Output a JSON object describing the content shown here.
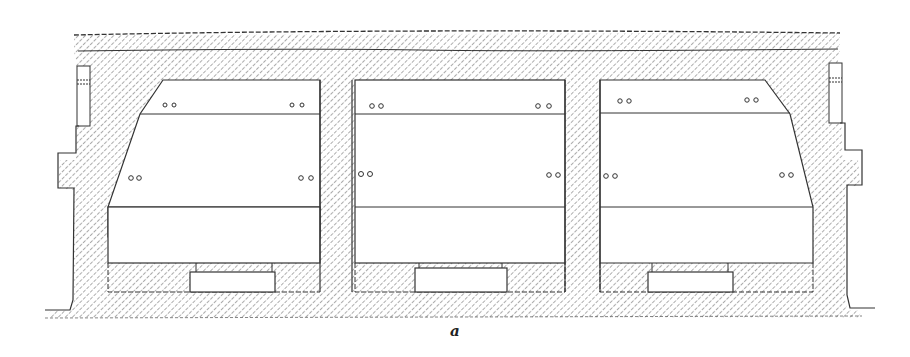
{
  "figure": {
    "caption": "a",
    "colors": {
      "ink": "#2a2a2a",
      "hatch": "#555555",
      "background": "#ffffff"
    }
  },
  "chambers": [
    {
      "id": "left",
      "bolt_pairs": 4
    },
    {
      "id": "middle",
      "bolt_pairs": 4
    },
    {
      "id": "right",
      "bolt_pairs": 4
    }
  ],
  "bolt_symbol": "oo"
}
